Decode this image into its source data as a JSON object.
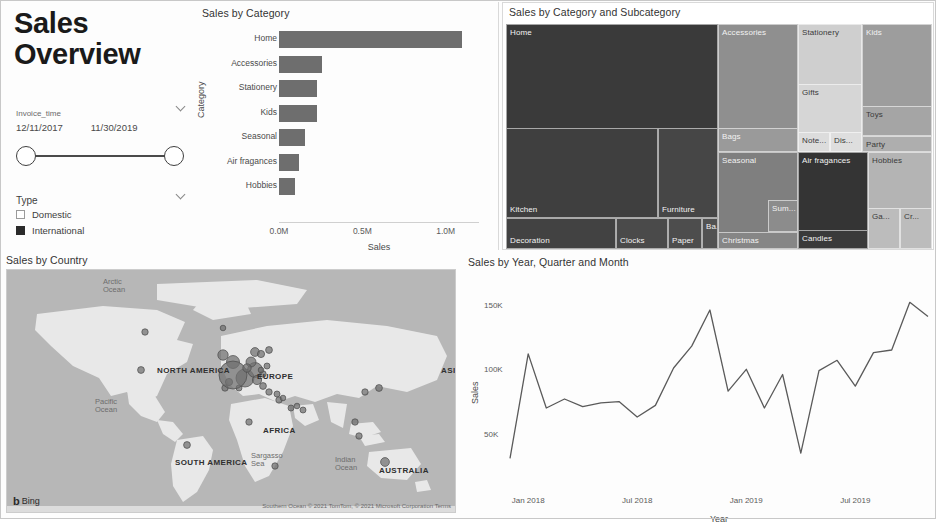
{
  "report": {
    "title_line1": "Sales",
    "title_line2": "Overview"
  },
  "date_slicer": {
    "field_label": "Invoice_time",
    "start_date": "12/11/2017",
    "end_date": "11/30/2019",
    "chevron": "chevron-down-icon"
  },
  "type_slicer": {
    "label": "Type",
    "chevron": "chevron-down-icon",
    "options": [
      {
        "label": "Domestic",
        "checked": false
      },
      {
        "label": "International",
        "checked": true
      }
    ]
  },
  "bar_chart": {
    "title": "Sales by Category"
  },
  "treemap": {
    "title": "Sales by Category and Subcategory"
  },
  "map": {
    "title": "Sales by Country",
    "provider": "Bing",
    "attribution": "Southern Ocean © 2021 TomTom, © 2021 Microsoft Corporation  Terms",
    "labels": [
      {
        "text": "Arctic Ocean",
        "type": "ocean"
      },
      {
        "text": "NORTH AMERICA",
        "type": "continent"
      },
      {
        "text": "Pacific Ocean",
        "type": "ocean"
      },
      {
        "text": "Sargasso Sea",
        "type": "ocean"
      },
      {
        "text": "SOUTH AMERICA",
        "type": "continent"
      },
      {
        "text": "EUROPE",
        "type": "continent"
      },
      {
        "text": "ASIA",
        "type": "continent"
      },
      {
        "text": "AFRICA",
        "type": "continent"
      },
      {
        "text": "AUSTRALIA",
        "type": "continent"
      },
      {
        "text": "Indian Ocean",
        "type": "ocean"
      }
    ]
  },
  "line_chart": {
    "title": "Sales by Year, Quarter and Month"
  },
  "colors": {
    "bar_fill": "#6e6e6e",
    "line_stroke": "#5a5a5a",
    "map_water": "#b7b7b7",
    "map_land": "#e8e8e8",
    "bubble": "#6f6f6f",
    "panel_border": "#d9d9d9"
  },
  "chart_data": [
    {
      "type": "bar",
      "id": "sales-by-category",
      "title": "Sales by Category",
      "orientation": "horizontal",
      "xlabel": "Sales",
      "ylabel": "Category",
      "categories": [
        "Home",
        "Accessories",
        "Stationery",
        "Kids",
        "Seasonal",
        "Air fragances",
        "Hobbies"
      ],
      "values": [
        1100000,
        260000,
        230000,
        225000,
        155000,
        120000,
        95000
      ],
      "xlim": [
        0,
        1200000
      ],
      "xticks": [
        0,
        500000,
        1000000
      ],
      "xtick_labels": [
        "0.0M",
        "0.5M",
        "1.0M"
      ],
      "grid": false,
      "legend": "none"
    },
    {
      "type": "treemap",
      "id": "sales-by-category-and-subcategory",
      "title": "Sales by Category and Subcategory",
      "legend": "none",
      "nodes": [
        {
          "category": "Home",
          "label": "Home",
          "value": 1100000,
          "shade": "#3a3a3a"
        },
        {
          "category": "Home",
          "label": "Kitchen",
          "value": 430000,
          "shade": "#3f3f3f"
        },
        {
          "category": "Home",
          "label": "Furniture",
          "value": 150000,
          "shade": "#464646"
        },
        {
          "category": "Home",
          "label": "Decoration",
          "value": 180000,
          "shade": "#424242"
        },
        {
          "category": "Home",
          "label": "Clocks",
          "value": 60000,
          "shade": "#4a4a4a"
        },
        {
          "category": "Home",
          "label": "Paper",
          "value": 45000,
          "shade": "#4d4d4d"
        },
        {
          "category": "Home",
          "label": "Ba...",
          "value": 18000,
          "shade": "#525252"
        },
        {
          "category": "Accessories",
          "label": "Accessories",
          "value": 260000,
          "shade": "#8f8f8f"
        },
        {
          "category": "Accessories",
          "label": "Bags",
          "value": 70000,
          "shade": "#9a9a9a"
        },
        {
          "category": "Stationery",
          "label": "Stationery",
          "value": 230000,
          "shade": "#cfcfcf"
        },
        {
          "category": "Stationery",
          "label": "Gifts",
          "value": 120000,
          "shade": "#d6d6d6"
        },
        {
          "category": "Stationery",
          "label": "Note...",
          "value": 30000,
          "shade": "#dcdcdc"
        },
        {
          "category": "Stationery",
          "label": "Dis...",
          "value": 26000,
          "shade": "#dedede"
        },
        {
          "category": "Kids",
          "label": "Kids",
          "value": 225000,
          "shade": "#9d9d9d"
        },
        {
          "category": "Kids",
          "label": "Toys",
          "value": 90000,
          "shade": "#a5a5a5"
        },
        {
          "category": "Kids",
          "label": "Party",
          "value": 40000,
          "shade": "#aeaeae"
        },
        {
          "category": "Seasonal",
          "label": "Seasonal",
          "value": 155000,
          "shade": "#7f7f7f"
        },
        {
          "category": "Seasonal",
          "label": "Christmas",
          "value": 80000,
          "shade": "#868686"
        },
        {
          "category": "Seasonal",
          "label": "Sum...",
          "value": 30000,
          "shade": "#8c8c8c"
        },
        {
          "category": "Air fragances",
          "label": "Air fragances",
          "value": 120000,
          "shade": "#343434"
        },
        {
          "category": "Air fragances",
          "label": "Candles",
          "value": 70000,
          "shade": "#3a3a3a"
        },
        {
          "category": "Hobbies",
          "label": "Hobbies",
          "value": 95000,
          "shade": "#b4b4b4"
        },
        {
          "category": "Hobbies",
          "label": "Ga...",
          "value": 26000,
          "shade": "#bcbcbc"
        },
        {
          "category": "Hobbies",
          "label": "Cr...",
          "value": 22000,
          "shade": "#bcbcbc"
        }
      ]
    },
    {
      "type": "scatter",
      "id": "sales-by-country",
      "title": "Sales by Country",
      "map": true,
      "legend": "none",
      "bubbles": [
        {
          "region": "Canada",
          "x": 138,
          "y": 62,
          "r": 3.2
        },
        {
          "region": "United States",
          "x": 134,
          "y": 100,
          "r": 3.4
        },
        {
          "region": "Brazil",
          "x": 180,
          "y": 175,
          "r": 3.4
        },
        {
          "region": "Greenland",
          "x": 216,
          "y": 58,
          "r": 2.8
        },
        {
          "region": "Iceland",
          "x": 216,
          "y": 85,
          "r": 5.2
        },
        {
          "region": "United Kingdom",
          "x": 226,
          "y": 92,
          "r": 6.5
        },
        {
          "region": "Ireland",
          "x": 222,
          "y": 112,
          "r": 3.6
        },
        {
          "region": "Portugal",
          "x": 218,
          "y": 118,
          "r": 3.2
        },
        {
          "region": "Spain",
          "x": 232,
          "y": 118,
          "r": 3.0
        },
        {
          "region": "France",
          "x": 238,
          "y": 108,
          "r": 9.0
        },
        {
          "region": "EIRE",
          "x": 226,
          "y": 105,
          "r": 14.0
        },
        {
          "region": "Germany",
          "x": 248,
          "y": 100,
          "r": 7.5
        },
        {
          "region": "Netherlands",
          "x": 244,
          "y": 92,
          "r": 5.0
        },
        {
          "region": "Belgium",
          "x": 240,
          "y": 98,
          "r": 4.2
        },
        {
          "region": "Switzerland",
          "x": 250,
          "y": 110,
          "r": 4.6
        },
        {
          "region": "Italy",
          "x": 256,
          "y": 116,
          "r": 3.4
        },
        {
          "region": "Norway",
          "x": 248,
          "y": 82,
          "r": 4.4
        },
        {
          "region": "Sweden",
          "x": 254,
          "y": 84,
          "r": 3.6
        },
        {
          "region": "Finland",
          "x": 262,
          "y": 80,
          "r": 3.4
        },
        {
          "region": "Poland",
          "x": 260,
          "y": 96,
          "r": 3.0
        },
        {
          "region": "Austria",
          "x": 256,
          "y": 104,
          "r": 3.2
        },
        {
          "region": "Czech Republic",
          "x": 254,
          "y": 100,
          "r": 2.8
        },
        {
          "region": "Greece",
          "x": 262,
          "y": 122,
          "r": 3.2
        },
        {
          "region": "Cyprus",
          "x": 270,
          "y": 124,
          "r": 3.0
        },
        {
          "region": "Israel",
          "x": 272,
          "y": 130,
          "r": 3.2
        },
        {
          "region": "Lebanon",
          "x": 276,
          "y": 128,
          "r": 2.8
        },
        {
          "region": "Saudi Arabia",
          "x": 284,
          "y": 138,
          "r": 3.0
        },
        {
          "region": "Bahrain",
          "x": 290,
          "y": 136,
          "r": 2.8
        },
        {
          "region": "United Arab Emirates",
          "x": 296,
          "y": 140,
          "r": 3.0
        },
        {
          "region": "Nigeria",
          "x": 242,
          "y": 152,
          "r": 3.2
        },
        {
          "region": "South Africa",
          "x": 268,
          "y": 196,
          "r": 3.2
        },
        {
          "region": "Japan",
          "x": 372,
          "y": 118,
          "r": 3.4
        },
        {
          "region": "Hong Kong",
          "x": 358,
          "y": 122,
          "r": 3.2
        },
        {
          "region": "Singapore",
          "x": 348,
          "y": 152,
          "r": 3.2
        },
        {
          "region": "Indonesia",
          "x": 352,
          "y": 166,
          "r": 3.2
        },
        {
          "region": "Australia",
          "x": 378,
          "y": 192,
          "r": 4.4
        }
      ]
    },
    {
      "type": "line",
      "id": "sales-by-year-quarter-month",
      "title": "Sales by Year, Quarter and Month",
      "xlabel": "Year",
      "ylabel": "Sales",
      "ylim": [
        25000,
        160000
      ],
      "yticks": [
        50000,
        100000,
        150000
      ],
      "ytick_labels": [
        "50K",
        "100K",
        "150K"
      ],
      "xticks": [
        "Jan 2018",
        "Jul 2018",
        "Jan 2019",
        "Jul 2019"
      ],
      "grid": false,
      "legend": "none",
      "x": [
        "Dec 2017",
        "Jan 2018",
        "Feb 2018",
        "Mar 2018",
        "Apr 2018",
        "May 2018",
        "Jun 2018",
        "Jul 2018",
        "Aug 2018",
        "Sep 2018",
        "Oct 2018",
        "Nov 2018",
        "Dec 2018",
        "Jan 2019",
        "Feb 2019",
        "Mar 2019",
        "Apr 2019",
        "May 2019",
        "Jun 2019",
        "Jul 2019",
        "Aug 2019",
        "Sep 2019",
        "Oct 2019",
        "Nov 2019"
      ],
      "values": [
        31000,
        112000,
        70000,
        77000,
        71000,
        74000,
        75000,
        63000,
        72000,
        101000,
        118000,
        146000,
        83000,
        100000,
        70000,
        96000,
        35000,
        99000,
        107000,
        87000,
        113000,
        115000,
        152000,
        141000
      ]
    }
  ]
}
